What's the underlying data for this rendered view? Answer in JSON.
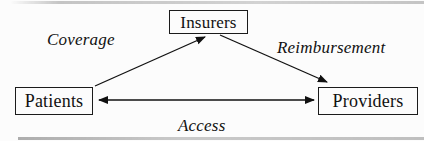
{
  "diagram": {
    "nodes": {
      "insurers": {
        "label": "Insurers"
      },
      "patients": {
        "label": "Patients"
      },
      "providers": {
        "label": "Providers"
      }
    },
    "edges": {
      "coverage": {
        "label": "Coverage",
        "from": "Patients",
        "to": "Insurers",
        "direction": "one-way"
      },
      "reimbursement": {
        "label": "Reimbursement",
        "from": "Insurers",
        "to": "Providers",
        "direction": "one-way"
      },
      "access": {
        "label": "Access",
        "from": "Patients",
        "to": "Providers",
        "direction": "two-way"
      }
    },
    "colors": {
      "line": "#111111",
      "border": "#1b1b1b",
      "background": "#fcfcfc"
    }
  }
}
